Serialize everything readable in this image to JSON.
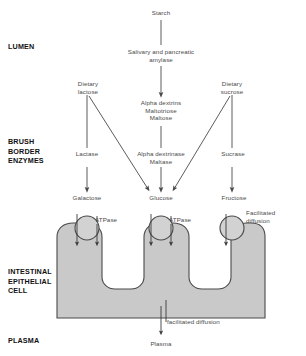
{
  "diagram": {
    "colors": {
      "cell_fill": "#c9c9c9",
      "cell_stroke": "#4a4a4a",
      "circle_fill": "#d2d2d2",
      "line": "#4a4a4a",
      "text": "#4a4a4a",
      "section_text": "#111111",
      "background": "#ffffff"
    },
    "sections": [
      {
        "id": "lumen",
        "label": "LUMEN"
      },
      {
        "id": "brush-border-enzymes",
        "label": "BRUSH\nBORDER\nENZYMES"
      },
      {
        "id": "intestinal-epithelial-cell",
        "label": "INTESTINAL\nEPITHELIAL\nCELL"
      },
      {
        "id": "plasma",
        "label": "PLASMA"
      }
    ],
    "nodes": [
      {
        "id": "starch",
        "label": "Starch"
      },
      {
        "id": "salivary-amylase",
        "label": "Salivary and pancreatic\namylase"
      },
      {
        "id": "dietary-lactose",
        "label": "Dietary\nlactose"
      },
      {
        "id": "dietary-sucrose",
        "label": "Dietary\nsucrose"
      },
      {
        "id": "alpha-dextrins",
        "label": "Alpha dextrins\nMaltotriose\nMaltose"
      },
      {
        "id": "lactase",
        "label": "Lactase"
      },
      {
        "id": "alpha-dextrinase",
        "label": "Alpha dextrinase\nMaltase"
      },
      {
        "id": "sucrase",
        "label": "Sucrase"
      },
      {
        "id": "galactose",
        "label": "Galactose"
      },
      {
        "id": "glucose-lumen",
        "label": "Glucose"
      },
      {
        "id": "fructose",
        "label": "Fructose"
      },
      {
        "id": "atpase-left",
        "label": "ATPase"
      },
      {
        "id": "atpase-middle",
        "label": "ATPase"
      },
      {
        "id": "facilitated-diffusion",
        "label": "Facilitated\ndiffusion"
      },
      {
        "id": "glucose-cell",
        "label": "Glucose"
      },
      {
        "id": "carrier-mediated",
        "label": "Carrier mediated and\nfacilitated diffusion"
      },
      {
        "id": "plasma-node",
        "label": "Plasma"
      }
    ]
  }
}
